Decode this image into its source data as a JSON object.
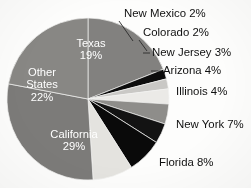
{
  "chart_data": {
    "type": "pie",
    "title": "",
    "subtitle": "",
    "xlabel": "",
    "ylabel": "",
    "legend_position": "none",
    "grid": false,
    "start_angle_deg": 0,
    "direction": "clockwise",
    "categories": [
      "Texas",
      "New Mexico",
      "Colorado",
      "New Jersey",
      "Arizona",
      "Illinois",
      "New York",
      "Florida",
      "California",
      "Other States"
    ],
    "values": [
      19,
      2,
      2,
      3,
      4,
      4,
      7,
      8,
      29,
      22
    ],
    "slices": [
      {
        "name": "Texas",
        "label": "Texas",
        "value_label": "19%",
        "value": 19,
        "color": "#82817f",
        "label_placement": "inside",
        "label_lines": [
          "Texas",
          "19%"
        ],
        "label_x": 91,
        "label_y": 47,
        "leader": null
      },
      {
        "name": "New Mexico",
        "label": "New Mexico",
        "value_label": "2%",
        "value": 2,
        "color": "#0d0d0d",
        "label_placement": "outside",
        "label_lines": [
          "New Mexico 2%"
        ],
        "label_x": 124,
        "label_y": 14,
        "leader": {
          "x1": 119,
          "y1": 21,
          "x2": 133,
          "y2": 41
        }
      },
      {
        "name": "Colorado",
        "label": "Colorado",
        "value_label": "2%",
        "value": 2,
        "color": "#c9c8c5",
        "label_placement": "outside",
        "label_lines": [
          "Colorado 2%"
        ],
        "label_x": 143,
        "label_y": 33,
        "leader": {
          "x1": 139,
          "y1": 40,
          "x2": 147,
          "y2": 51
        }
      },
      {
        "name": "New Jersey",
        "label": "New Jersey",
        "value_label": "3%",
        "value": 3,
        "color": "#ebeae7",
        "label_placement": "outside",
        "label_lines": [
          "New Jersey 3%"
        ],
        "label_x": 152,
        "label_y": 53,
        "leader": {
          "x1": 143,
          "y1": 53,
          "x2": 150,
          "y2": 53
        }
      },
      {
        "name": "Arizona",
        "label": "Arizona",
        "value_label": "4%",
        "value": 4,
        "color": "#8e8d8a",
        "label_placement": "outside",
        "label_lines": [
          "Arizona 4%"
        ],
        "label_x": 163,
        "label_y": 71,
        "leader": {
          "x1": 151,
          "y1": 71,
          "x2": 161,
          "y2": 71
        }
      },
      {
        "name": "Illinois",
        "label": "Illinois",
        "value_label": "4%",
        "value": 4,
        "color": "#131313",
        "label_placement": "outside",
        "label_lines": [
          "Illinois 4%"
        ],
        "label_x": 176,
        "label_y": 92,
        "leader": null
      },
      {
        "name": "New York",
        "label": "New York",
        "value_label": "7%",
        "value": 7,
        "color": "#0a0a0a",
        "label_placement": "outside",
        "label_lines": [
          "New York 7%"
        ],
        "label_x": 176,
        "label_y": 125,
        "leader": null
      },
      {
        "name": "Florida",
        "label": "Florida",
        "value_label": "8%",
        "value": 8,
        "color": "#e4e3df",
        "label_placement": "outside",
        "label_lines": [
          "Florida 8%"
        ],
        "label_x": 159,
        "label_y": 163,
        "leader": null
      },
      {
        "name": "California",
        "label": "California",
        "value_label": "29%",
        "value": 29,
        "color": "#7c7b79",
        "label_placement": "inside",
        "label_lines": [
          "California",
          "29%"
        ],
        "label_x": 74,
        "label_y": 138,
        "leader": null
      },
      {
        "name": "Other States",
        "label": "Other States",
        "value_label": "22%",
        "value": 22,
        "color": "#888784",
        "label_placement": "inside",
        "label_lines": [
          "Other",
          "States",
          "22%"
        ],
        "label_x": 42,
        "label_y": 76,
        "leader": null
      }
    ],
    "geometry": {
      "center_x": 88,
      "center_y": 99,
      "radius": 81
    },
    "background_color": "#fdfdfc"
  }
}
